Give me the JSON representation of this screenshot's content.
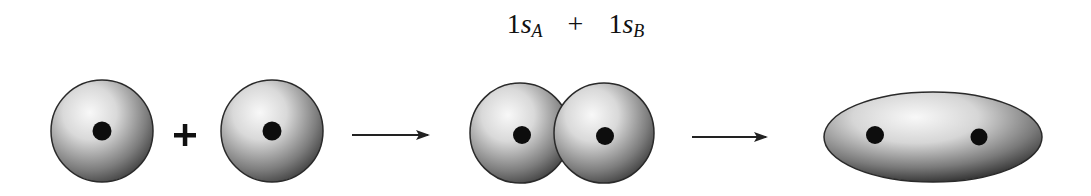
{
  "title": {
    "term_a": {
      "coef": "1",
      "orbital": "s",
      "sub": "A"
    },
    "operator": "+",
    "term_b": {
      "coef": "1",
      "orbital": "s",
      "sub": "B"
    }
  },
  "diagram": {
    "steps": [
      {
        "name": "separate-atoms",
        "description": "Two 1s atomic orbitals, each with a nucleus"
      },
      {
        "name": "overlapping-atoms",
        "description": "Orbitals approach and overlap"
      },
      {
        "name": "molecular-orbital",
        "description": "Combined elongated bonding orbital with two nuclei"
      }
    ],
    "plus_symbol": "+",
    "colors": {
      "orbital_light": "#f4f4f4",
      "orbital_dark": "#3a3a3a",
      "outline": "#2a2a2a",
      "nucleus": "#0d0d0d",
      "arrow": "#222222"
    }
  }
}
